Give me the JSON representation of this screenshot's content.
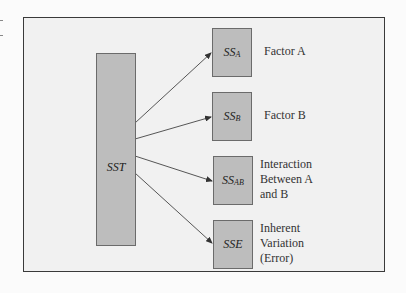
{
  "diagram": {
    "type": "decomposition",
    "title": "",
    "source": {
      "label": "SST",
      "label_main": "SST",
      "label_sub": ""
    },
    "components": [
      {
        "symbol_main": "SS",
        "symbol_sub": "A",
        "description": "Factor A"
      },
      {
        "symbol_main": "SS",
        "symbol_sub": "B",
        "description": "Factor B"
      },
      {
        "symbol_main": "SS",
        "symbol_sub": "AB",
        "description": "Interaction\nBetween A\nand B"
      },
      {
        "symbol_main": "SSE",
        "symbol_sub": "",
        "description": "Inherent\nVariation\n(Error)"
      }
    ],
    "colors": {
      "box_fill": "#bdbdbd",
      "box_border": "#6b6b6b",
      "panel_fill": "#f1f1f1",
      "frame_border": "#3a3a3a",
      "arrow": "#333333"
    }
  }
}
